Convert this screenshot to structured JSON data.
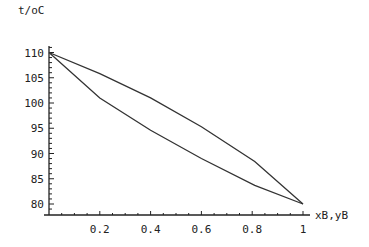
{
  "chart_data": {
    "type": "line",
    "title": "",
    "xlabel": "xB,yB",
    "ylabel": "t/oC",
    "xlim": [
      0,
      1
    ],
    "ylim": [
      79,
      111
    ],
    "grid": false,
    "legend": null,
    "x_ticks": [
      0.2,
      0.4,
      0.6,
      0.8,
      1
    ],
    "x_tick_labels": [
      "0.2",
      "0.4",
      "0.6",
      "0.8",
      "1"
    ],
    "y_ticks": [
      80,
      85,
      90,
      95,
      100,
      105,
      110
    ],
    "y_tick_labels": [
      "80",
      "85",
      "90",
      "95",
      "100",
      "105",
      "110"
    ],
    "series": [
      {
        "name": "vapour (dew) curve",
        "x": [
          0,
          0.2,
          0.4,
          0.6,
          0.81,
          1
        ],
        "y": [
          110,
          105.8,
          101.0,
          95.3,
          88.4,
          80
        ]
      },
      {
        "name": "liquid (bubble) curve",
        "x": [
          0,
          0.2,
          0.4,
          0.6,
          0.81,
          1
        ],
        "y": [
          110,
          101.0,
          94.6,
          89.0,
          83.7,
          80
        ]
      }
    ],
    "line_color": "#333333"
  }
}
